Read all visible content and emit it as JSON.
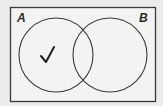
{
  "diagram": {
    "type": "venn",
    "sets": [
      {
        "label": "A",
        "cx": 56,
        "cy": 55,
        "r": 37
      },
      {
        "label": "B",
        "cx": 110,
        "cy": 55,
        "r": 37
      }
    ],
    "universe": {
      "x": 10,
      "y": 7,
      "width": 145,
      "height": 94
    },
    "marks": [
      {
        "symbol": "✓",
        "region": "A only"
      }
    ],
    "colors": {
      "stroke": "#3a3a3a",
      "background": "#ececea",
      "fill": "#f4f4f2"
    }
  }
}
